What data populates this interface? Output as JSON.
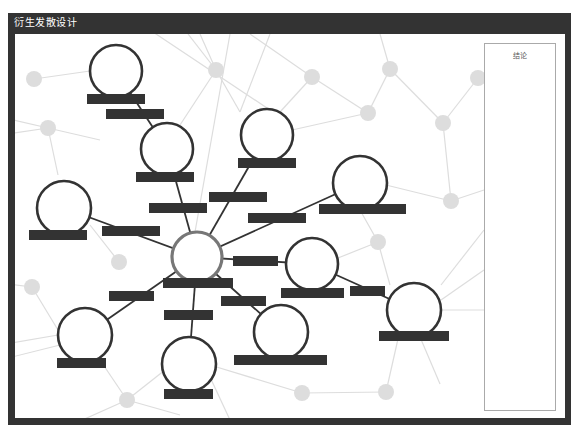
{
  "window": {
    "title": "衍生发散设计"
  },
  "panel": {
    "conclusion_label": "结论"
  },
  "colors": {
    "frame": "#333333",
    "node_stroke": "#333333",
    "center_stroke": "#777777",
    "label_fill": "#333333",
    "bg_node": "#dddddd",
    "bg_line": "#dddddd",
    "edge": "#333333"
  },
  "diagram": {
    "center": {
      "id": "center",
      "cx": 197,
      "cy": 257,
      "r": 25,
      "label_box": [
        163,
        278,
        70,
        10
      ]
    },
    "nodes": [
      {
        "id": "n1",
        "cx": 116,
        "cy": 71,
        "r": 26,
        "label_box": [
          87,
          94,
          58,
          10
        ]
      },
      {
        "id": "n2",
        "cx": 167,
        "cy": 149,
        "r": 26,
        "label_box": [
          136,
          172,
          58,
          10
        ]
      },
      {
        "id": "n3",
        "cx": 267,
        "cy": 135,
        "r": 26,
        "label_box": [
          238,
          158,
          58,
          10
        ]
      },
      {
        "id": "n4",
        "cx": 64,
        "cy": 208,
        "r": 27,
        "label_box": [
          29,
          230,
          58,
          10
        ]
      },
      {
        "id": "n5",
        "cx": 360,
        "cy": 183,
        "r": 27,
        "label_box": [
          319,
          204,
          87,
          10
        ]
      },
      {
        "id": "n6",
        "cx": 312,
        "cy": 264,
        "r": 26,
        "label_box": [
          281,
          288,
          63,
          10
        ]
      },
      {
        "id": "n7",
        "cx": 414,
        "cy": 310,
        "r": 27,
        "label_box": [
          379,
          331,
          70,
          10
        ]
      },
      {
        "id": "n8",
        "cx": 85,
        "cy": 335,
        "r": 27,
        "label_box": [
          57,
          358,
          49,
          10
        ]
      },
      {
        "id": "n9",
        "cx": 189,
        "cy": 364,
        "r": 27,
        "label_box": [
          164,
          389,
          49,
          10
        ]
      },
      {
        "id": "n10",
        "cx": 281,
        "cy": 332,
        "r": 27,
        "label_box": [
          234,
          355,
          93,
          10
        ]
      }
    ],
    "edges": [
      {
        "from": "n1",
        "to": "n2",
        "label_box": [
          106,
          109,
          58,
          10
        ]
      },
      {
        "from": "n2",
        "to": "center",
        "label_box": [
          149,
          203,
          58,
          10
        ]
      },
      {
        "from": "n3",
        "to": "center",
        "label_box": [
          209,
          192,
          58,
          10
        ]
      },
      {
        "from": "n4",
        "to": "center",
        "label_box": [
          102,
          226,
          58,
          10
        ]
      },
      {
        "from": "n5",
        "to": "center",
        "label_box": [
          248,
          213,
          58,
          10
        ]
      },
      {
        "from": "n6",
        "to": "center",
        "label_box": [
          233,
          256,
          45,
          10
        ]
      },
      {
        "from": "n6",
        "to": "n7",
        "label_box": [
          350,
          286,
          35,
          10
        ]
      },
      {
        "from": "n8",
        "to": "center",
        "label_box": [
          109,
          291,
          45,
          10
        ]
      },
      {
        "from": "n9",
        "to": "center",
        "label_box": [
          164,
          310,
          49,
          10
        ]
      },
      {
        "from": "n10",
        "to": "center",
        "label_box": [
          221,
          296,
          45,
          10
        ]
      }
    ],
    "background_nodes": [
      {
        "cx": 34,
        "cy": 79
      },
      {
        "cy": 128,
        "cx": 48
      },
      {
        "cx": 216,
        "cy": 70
      },
      {
        "cx": 312,
        "cy": 77
      },
      {
        "cx": 368,
        "cy": 113
      },
      {
        "cx": 390,
        "cy": 69
      },
      {
        "cx": 443,
        "cy": 123
      },
      {
        "cx": 478,
        "cy": 78
      },
      {
        "cx": 451,
        "cy": 201
      },
      {
        "cx": 378,
        "cy": 242
      },
      {
        "cx": 119,
        "cy": 262
      },
      {
        "cx": 32,
        "cy": 287
      },
      {
        "cx": 127,
        "cy": 400
      },
      {
        "cx": 302,
        "cy": 393
      },
      {
        "cx": 386,
        "cy": 392
      }
    ],
    "background_lines": [
      [
        34,
        79,
        90,
        71
      ],
      [
        48,
        128,
        0,
        117
      ],
      [
        48,
        128,
        0,
        135
      ],
      [
        48,
        128,
        58,
        175
      ],
      [
        48,
        128,
        100,
        140
      ],
      [
        216,
        70,
        200,
        34
      ],
      [
        216,
        70,
        188,
        34
      ],
      [
        216,
        70,
        240,
        112
      ],
      [
        216,
        70,
        180,
        125
      ],
      [
        312,
        77,
        250,
        34
      ],
      [
        312,
        77,
        368,
        113
      ],
      [
        312,
        77,
        280,
        112
      ],
      [
        368,
        113,
        292,
        130
      ],
      [
        368,
        113,
        390,
        69
      ],
      [
        390,
        69,
        380,
        34
      ],
      [
        390,
        69,
        443,
        123
      ],
      [
        443,
        123,
        478,
        78
      ],
      [
        443,
        123,
        451,
        201
      ],
      [
        451,
        201,
        386,
        185
      ],
      [
        451,
        201,
        484,
        190
      ],
      [
        378,
        242,
        338,
        258
      ],
      [
        378,
        242,
        390,
        285
      ],
      [
        378,
        242,
        360,
        210
      ],
      [
        119,
        262,
        90,
        225
      ],
      [
        32,
        287,
        0,
        283
      ],
      [
        32,
        287,
        58,
        330
      ],
      [
        127,
        400,
        100,
        360
      ],
      [
        127,
        400,
        60,
        430
      ],
      [
        127,
        400,
        180,
        415
      ],
      [
        127,
        400,
        165,
        370
      ],
      [
        302,
        393,
        210,
        365
      ],
      [
        302,
        393,
        386,
        392
      ],
      [
        386,
        392,
        400,
        330
      ],
      [
        441,
        285,
        484,
        230
      ],
      [
        441,
        300,
        484,
        270
      ],
      [
        441,
        310,
        484,
        310
      ],
      [
        420,
        337,
        440,
        384
      ],
      [
        210,
        377,
        230,
        420
      ],
      [
        58,
        335,
        0,
        345
      ],
      [
        60,
        345,
        0,
        360
      ],
      [
        160,
        30,
        200,
        20
      ],
      [
        150,
        30,
        270,
        110
      ],
      [
        230,
        34,
        195,
        232
      ],
      [
        270,
        34,
        240,
        112
      ]
    ]
  }
}
